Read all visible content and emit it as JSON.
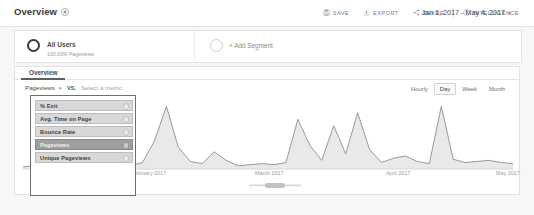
{
  "header": {
    "title": "Overview",
    "shortcut_icon": "shortcut-badge-icon",
    "actions": [
      {
        "label": "SAVE",
        "icon": "save-disk-icon"
      },
      {
        "label": "EXPORT",
        "icon": "export-download-icon"
      },
      {
        "label": "SHARE",
        "icon": "share-nodes-icon"
      },
      {
        "label": "INTELLIGENCE",
        "icon": "intelligence-lightbulb-icon"
      }
    ]
  },
  "segment_bar": {
    "segment": {
      "name": "All Users",
      "sub": "100.00% Pageviews",
      "icon": "segment-circle-icon"
    },
    "add_segment": {
      "label": "+ Add Segment",
      "icon": "add-segment-circle-icon"
    }
  },
  "date_range": {
    "value": "Jan 1, 2017 - May 4, 2017",
    "caret": "▾"
  },
  "tabs": [
    {
      "label": "Overview",
      "active": true
    }
  ],
  "metric_row": {
    "primary_metric": "Pageviews",
    "caret": "▾",
    "vs_label": "VS.",
    "secondary_placeholder": "Select a metric"
  },
  "granularity": [
    {
      "label": "Hourly",
      "active": false
    },
    {
      "label": "Day",
      "active": true
    },
    {
      "label": "Week",
      "active": false
    },
    {
      "label": "Month",
      "active": false
    }
  ],
  "metric_dropdown": {
    "open": true,
    "items": [
      {
        "label": "% Exit",
        "selected": false
      },
      {
        "label": "Avg. Time on Page",
        "selected": false
      },
      {
        "label": "Bounce Rate",
        "selected": false
      },
      {
        "label": "Pageviews",
        "selected": true
      },
      {
        "label": "Unique Pageviews",
        "selected": false
      }
    ]
  },
  "chart_data": {
    "type": "area",
    "title": "",
    "xlabel": "",
    "ylabel": "Pageviews",
    "legend": [],
    "grid": false,
    "axis_tick_labels": [
      "February 2017",
      "March 2017",
      "April 2017",
      "May 2017"
    ],
    "x": [
      "2017-01-01",
      "2017-01-04",
      "2017-01-07",
      "2017-01-10",
      "2017-01-13",
      "2017-01-16",
      "2017-01-19",
      "2017-01-22",
      "2017-01-25",
      "2017-01-28",
      "2017-01-31",
      "2017-02-03",
      "2017-02-06",
      "2017-02-09",
      "2017-02-12",
      "2017-02-15",
      "2017-02-18",
      "2017-02-21",
      "2017-02-24",
      "2017-02-27",
      "2017-03-02",
      "2017-03-05",
      "2017-03-08",
      "2017-03-11",
      "2017-03-14",
      "2017-03-17",
      "2017-03-20",
      "2017-03-23",
      "2017-03-26",
      "2017-03-29",
      "2017-04-01",
      "2017-04-04",
      "2017-04-07",
      "2017-04-10",
      "2017-04-13",
      "2017-04-16",
      "2017-04-19",
      "2017-04-22",
      "2017-04-25",
      "2017-04-28",
      "2017-05-01",
      "2017-05-04"
    ],
    "values": [
      2,
      3,
      2,
      4,
      3,
      2,
      3,
      2,
      4,
      3,
      6,
      26,
      58,
      20,
      7,
      5,
      16,
      8,
      3,
      4,
      5,
      4,
      6,
      46,
      22,
      8,
      40,
      14,
      52,
      18,
      6,
      10,
      12,
      7,
      5,
      58,
      9,
      6,
      7,
      8,
      6,
      5
    ],
    "ylim": [
      0,
      62
    ],
    "series_color": "#8f8f8f",
    "fill_color": "#e9e9e9"
  }
}
